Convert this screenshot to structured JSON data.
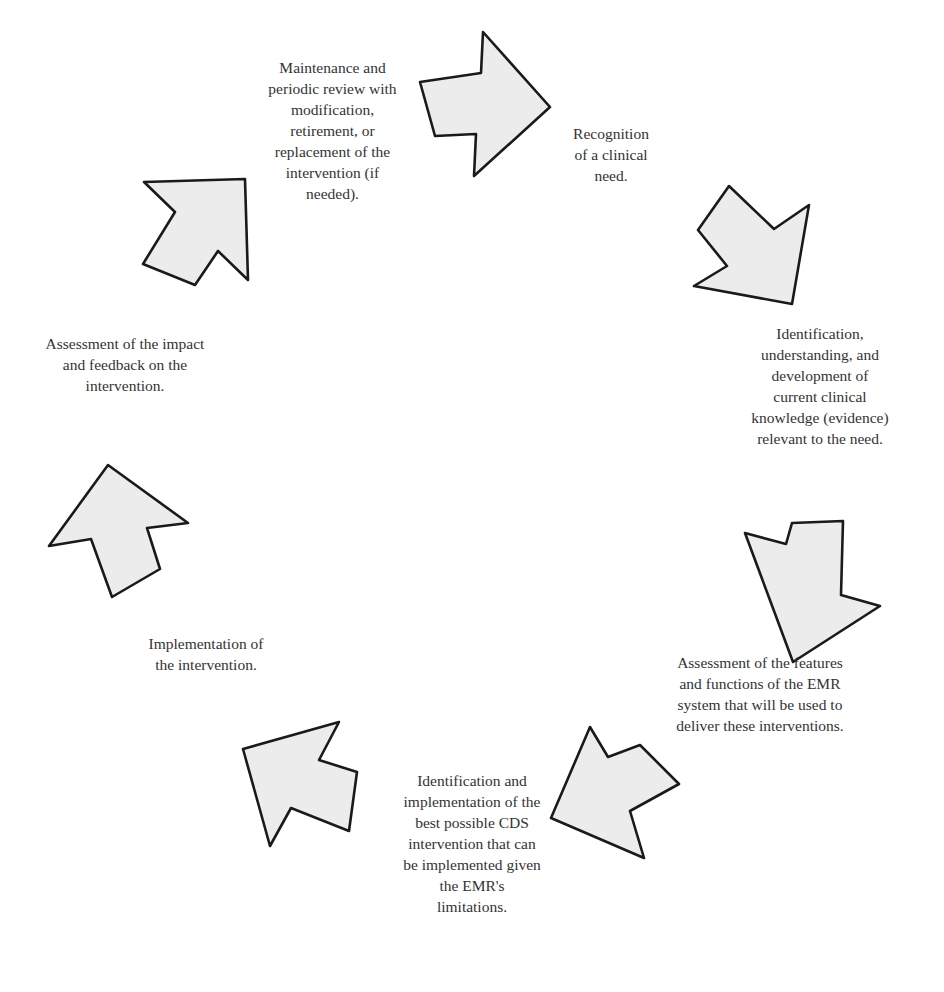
{
  "diagram": {
    "type": "cycle",
    "colors": {
      "arrow_fill": "#ececec",
      "arrow_stroke": "#1a1a1a",
      "text": "#333333",
      "background": "#ffffff"
    },
    "steps": [
      {
        "id": 1,
        "text": "Recognition\nof a clinical\nneed."
      },
      {
        "id": 2,
        "text": "Identification,\nunderstanding, and\ndevelopment of\ncurrent clinical\nknowledge (evidence)\nrelevant to the need."
      },
      {
        "id": 3,
        "text": "Assessment of the features\nand functions of the EMR\nsystem that will be used to\ndeliver these interventions."
      },
      {
        "id": 4,
        "text": "Identification and\nimplementation of the\nbest possible CDS\nintervention that can\nbe implemented given\nthe EMR's\nlimitations."
      },
      {
        "id": 5,
        "text": "Implementation of\nthe intervention."
      },
      {
        "id": 6,
        "text": "Assessment of the impact\nand feedback on the\nintervention."
      },
      {
        "id": 7,
        "text": "Maintenance and\nperiodic review with\nmodification,\nretirement, or\nreplacement of the\nintervention (if\nneeded)."
      }
    ],
    "arrows": [
      {
        "direction": "right",
        "points": "420,82 481,73 483,32 550,107 474,176 476,134 435,136"
      },
      {
        "direction": "down-right",
        "points": "698,230 729,186 774,229 809,205 792,304 694,286 727,266"
      },
      {
        "direction": "down",
        "points": "792,523 843,521 841,595 880,606 793,662 745,533 786,544"
      },
      {
        "direction": "down-left",
        "points": "590,727 608,757 640,745 679,784 630,811 644,858 551,818"
      },
      {
        "direction": "up-left",
        "points": "243,749 339,722 319,760 357,772 349,831 291,808 270,846"
      },
      {
        "direction": "up",
        "points": "108,465 188,523 147,528 160,569 112,597 91,539 49,546"
      },
      {
        "direction": "up-right",
        "points": "144,182 245,179 248,280 218,251 195,285 143,264 175,212"
      }
    ]
  }
}
